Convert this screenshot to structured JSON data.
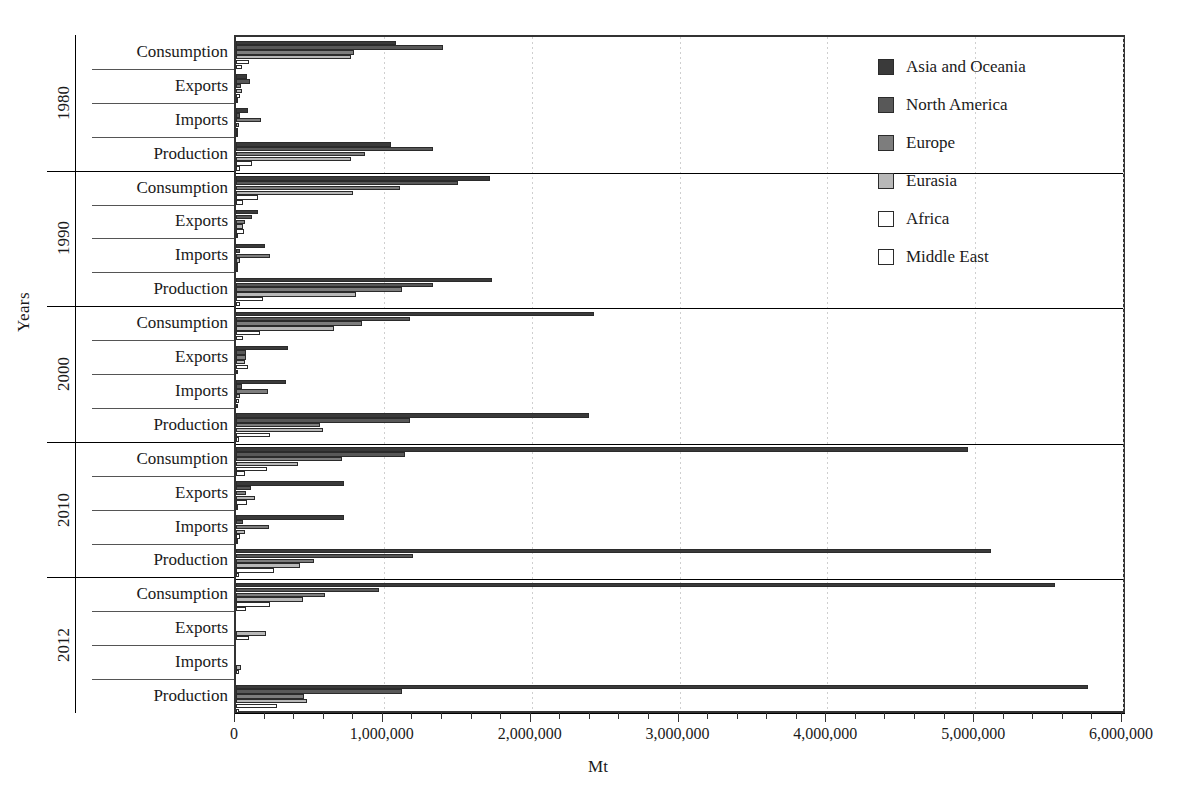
{
  "chart_data": {
    "type": "bar",
    "orientation": "horizontal",
    "title": "",
    "xlabel": "Mt",
    "ylabel": "Years",
    "xlim": [
      0,
      6000000
    ],
    "xticks": [
      0,
      1000000,
      2000000,
      3000000,
      4000000,
      5000000,
      6000000
    ],
    "xtick_labels": [
      "0",
      "1,000,000",
      "2,000,000",
      "3,000,000",
      "4,000,000",
      "5,000,000",
      "6,000,000"
    ],
    "minor_ticks_per_interval": 4,
    "grid": "vertical-dashed",
    "legend_position": "top-right",
    "series": [
      {
        "name": "Asia and Oceania",
        "color": "#3a3a3a"
      },
      {
        "name": "North America",
        "color": "#585858"
      },
      {
        "name": "Europe",
        "color": "#7d7d7d"
      },
      {
        "name": "Eurasia",
        "color": "#b8b8b8"
      },
      {
        "name": "Africa",
        "color": "#ffffff"
      },
      {
        "name": "Middle East",
        "color": "#ffffff"
      }
    ],
    "years": [
      "1980",
      "1990",
      "2000",
      "2010",
      "2012"
    ],
    "categories": [
      "Consumption",
      "Exports",
      "Imports",
      "Production"
    ],
    "groups": [
      {
        "year": "1980",
        "rows": [
          {
            "category": "Consumption",
            "values": {
              "Asia and Oceania": 1080000,
              "North America": 1400000,
              "Europe": 800000,
              "Eurasia": 780000,
              "Africa": 90000,
              "Middle East": 40000
            }
          },
          {
            "category": "Exports",
            "values": {
              "Asia and Oceania": 75000,
              "North America": 95000,
              "Europe": 35000,
              "Eurasia": 40000,
              "Africa": 30000,
              "Middle East": 5000
            }
          },
          {
            "category": "Imports",
            "values": {
              "Asia and Oceania": 80000,
              "North America": 25000,
              "Europe": 170000,
              "Eurasia": 20000,
              "Africa": 10000,
              "Middle East": 5000
            }
          },
          {
            "category": "Production",
            "values": {
              "Asia and Oceania": 1050000,
              "North America": 1330000,
              "Europe": 870000,
              "Eurasia": 780000,
              "Africa": 110000,
              "Middle East": 30000
            }
          }
        ]
      },
      {
        "year": "1990",
        "rows": [
          {
            "category": "Consumption",
            "values": {
              "Asia and Oceania": 1720000,
              "North America": 1500000,
              "Europe": 1110000,
              "Eurasia": 790000,
              "Africa": 150000,
              "Middle East": 45000
            }
          },
          {
            "category": "Exports",
            "values": {
              "Asia and Oceania": 150000,
              "North America": 110000,
              "Europe": 60000,
              "Eurasia": 50000,
              "Africa": 55000,
              "Middle East": 8000
            }
          },
          {
            "category": "Imports",
            "values": {
              "Asia and Oceania": 195000,
              "North America": 30000,
              "Europe": 230000,
              "Eurasia": 25000,
              "Africa": 15000,
              "Middle East": 6000
            }
          },
          {
            "category": "Production",
            "values": {
              "Asia and Oceania": 1730000,
              "North America": 1330000,
              "Europe": 1120000,
              "Eurasia": 810000,
              "Africa": 180000,
              "Middle East": 30000
            }
          }
        ]
      },
      {
        "year": "2000",
        "rows": [
          {
            "category": "Consumption",
            "values": {
              "Asia and Oceania": 2420000,
              "North America": 1180000,
              "Europe": 850000,
              "Eurasia": 660000,
              "Africa": 160000,
              "Middle East": 50000
            }
          },
          {
            "category": "Exports",
            "values": {
              "Asia and Oceania": 350000,
              "North America": 70000,
              "Europe": 70000,
              "Eurasia": 60000,
              "Africa": 80000,
              "Middle East": 10000
            }
          },
          {
            "category": "Imports",
            "values": {
              "Asia and Oceania": 340000,
              "North America": 40000,
              "Europe": 215000,
              "Eurasia": 30000,
              "Africa": 20000,
              "Middle East": 8000
            }
          },
          {
            "category": "Production",
            "values": {
              "Asia and Oceania": 2390000,
              "North America": 1180000,
              "Europe": 570000,
              "Eurasia": 590000,
              "Africa": 230000,
              "Middle East": 20000
            }
          }
        ]
      },
      {
        "year": "2010",
        "rows": [
          {
            "category": "Consumption",
            "values": {
              "Asia and Oceania": 4950000,
              "North America": 1140000,
              "Europe": 720000,
              "Eurasia": 420000,
              "Africa": 210000,
              "Middle East": 60000
            }
          },
          {
            "category": "Exports",
            "values": {
              "Asia and Oceania": 730000,
              "North America": 100000,
              "Europe": 70000,
              "Eurasia": 130000,
              "Africa": 75000,
              "Middle East": 12000
            }
          },
          {
            "category": "Imports",
            "values": {
              "Asia and Oceania": 730000,
              "North America": 50000,
              "Europe": 220000,
              "Eurasia": 60000,
              "Africa": 25000,
              "Middle East": 10000
            }
          },
          {
            "category": "Production",
            "values": {
              "Asia and Oceania": 5110000,
              "North America": 1200000,
              "Europe": 530000,
              "Eurasia": 430000,
              "Africa": 260000,
              "Middle East": 20000
            }
          }
        ]
      },
      {
        "year": "2012",
        "rows": [
          {
            "category": "Consumption",
            "values": {
              "Asia and Oceania": 5540000,
              "North America": 970000,
              "Europe": 600000,
              "Eurasia": 450000,
              "Africa": 230000,
              "Middle East": 70000
            }
          },
          {
            "category": "Exports",
            "values": {
              "Asia and Oceania": 0,
              "North America": 0,
              "Europe": 0,
              "Eurasia": 200000,
              "Africa": 90000,
              "Middle East": 0
            }
          },
          {
            "category": "Imports",
            "values": {
              "Asia and Oceania": 0,
              "North America": 0,
              "Europe": 0,
              "Eurasia": 35000,
              "Africa": 20000,
              "Middle East": 0
            }
          },
          {
            "category": "Production",
            "values": {
              "Asia and Oceania": 5760000,
              "North America": 1120000,
              "Europe": 460000,
              "Eurasia": 480000,
              "Africa": 280000,
              "Middle East": 20000
            }
          }
        ]
      }
    ]
  },
  "legend": {
    "items": [
      {
        "label": "Asia and Oceania",
        "color": "#3a3a3a"
      },
      {
        "label": "North America",
        "color": "#585858"
      },
      {
        "label": "Europe",
        "color": "#7d7d7d"
      },
      {
        "label": "Eurasia",
        "color": "#b8b8b8"
      },
      {
        "label": "Africa",
        "color": "#ffffff"
      },
      {
        "label": "Middle East",
        "color": "#ffffff"
      }
    ]
  },
  "axes": {
    "y_title": "Years",
    "x_title": "Mt"
  }
}
